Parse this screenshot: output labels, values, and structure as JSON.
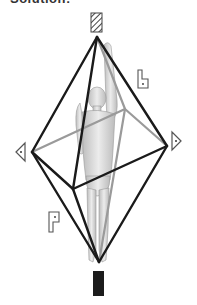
{
  "header": {
    "cut_title": "Solution:"
  },
  "diagram": {
    "vertices": {
      "top": [
        97,
        37
      ],
      "left": [
        32,
        152
      ],
      "right": [
        167,
        146
      ],
      "bottom": [
        99,
        262
      ],
      "front": [
        73,
        189
      ],
      "back": [
        125,
        109
      ]
    },
    "edges_front_color": "#1a1a1a",
    "edges_back_color": "#9a9a9a",
    "markers": {
      "top_marker": "hatched-rectangle",
      "bottom_marker": "solid-black-rectangle",
      "left_marker": "triangle-pointing-left-with-dot",
      "right_marker": "triangle-pointing-right-with-dot",
      "b_label": "b",
      "p_label": "p"
    }
  }
}
